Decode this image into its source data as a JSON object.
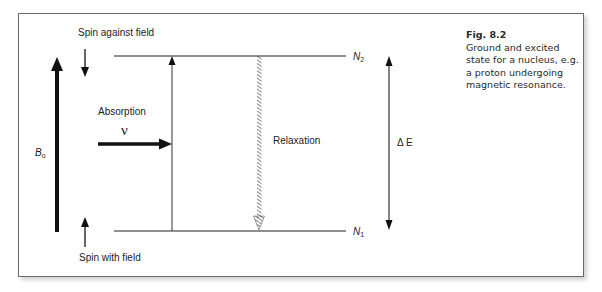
{
  "figure": {
    "number": "Fig. 8.2",
    "caption": "Ground and excited state for a nucleus, e.g. a proton undergoing magnetic resonance."
  },
  "labels": {
    "spin_against_field": "Spin against field",
    "spin_with_field": "Spin with field",
    "absorption": "Absorption",
    "frequency_symbol": "ν",
    "relaxation": "Relaxation",
    "field_symbol": "B",
    "field_subscript": "o",
    "upper_level_symbol": "N",
    "upper_level_subscript": "2",
    "lower_level_symbol": "N",
    "lower_level_subscript": "1",
    "energy_gap": "Δ E"
  },
  "colors": {
    "line": "#1a1a1a",
    "frame_border": "#6a6a6a",
    "background": "#ffffff"
  }
}
